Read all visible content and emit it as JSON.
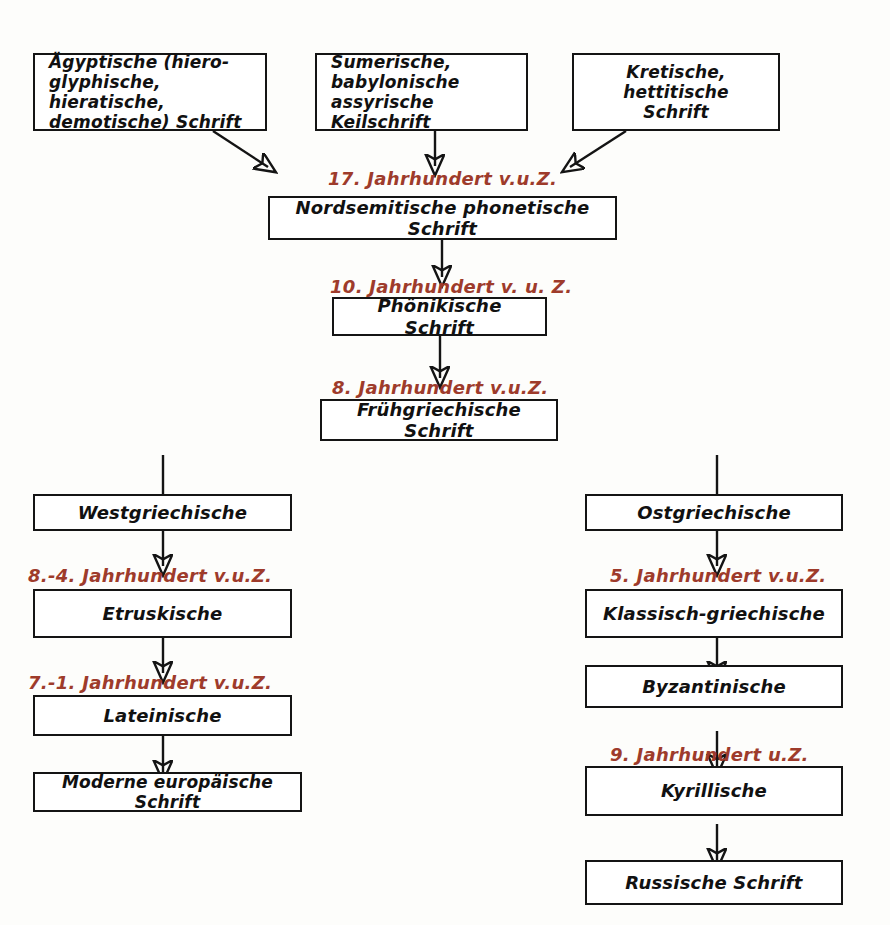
{
  "diagram": {
    "colors": {
      "box_border": "#141414",
      "box_text": "#111111",
      "era_text": "#9e3b2b",
      "background": "#fdfdfb",
      "connector": "#141414"
    },
    "nodes": [
      {
        "id": "aegyptische",
        "label": "Ägyptische (hiero-\nglyphische, hieratische,\ndemotische) Schrift"
      },
      {
        "id": "keilschrift",
        "label": "Sumerische, babylonische\nassyrische Keilschrift"
      },
      {
        "id": "kretische",
        "label": "Kretische, hettitische\nSchrift"
      },
      {
        "id": "nordsemitische",
        "label": "Nordsemitische phonetische Schrift"
      },
      {
        "id": "phoenikische",
        "label": "Phönikische Schrift"
      },
      {
        "id": "fruehgriechische",
        "label": "Frühgriechische Schrift"
      },
      {
        "id": "westgriechische",
        "label": "Westgriechische"
      },
      {
        "id": "etruskische",
        "label": "Etruskische"
      },
      {
        "id": "lateinische",
        "label": "Lateinische"
      },
      {
        "id": "moderne",
        "label": "Moderne europäische Schrift"
      },
      {
        "id": "ostgriechische",
        "label": "Ostgriechische"
      },
      {
        "id": "klassisch",
        "label": "Klassisch-griechische"
      },
      {
        "id": "byzantinische",
        "label": "Byzantinische"
      },
      {
        "id": "kyrillische",
        "label": "Kyrillische"
      },
      {
        "id": "russische",
        "label": "Russische Schrift"
      }
    ],
    "eras": [
      {
        "id": "era-17",
        "label": "17. Jahrhundert v.u.Z."
      },
      {
        "id": "era-10",
        "label": "10. Jahrhundert v. u. Z."
      },
      {
        "id": "era-8",
        "label": "8. Jahrhundert v.u.Z."
      },
      {
        "id": "era-8-4",
        "label": "8.-4. Jahrhundert  v.u.Z."
      },
      {
        "id": "era-7-1",
        "label": "7.-1. Jahrhundert  v.u.Z."
      },
      {
        "id": "era-5",
        "label": "5. Jahrhundert v.u.Z."
      },
      {
        "id": "era-9",
        "label": "9. Jahrhundert u.Z."
      }
    ]
  }
}
